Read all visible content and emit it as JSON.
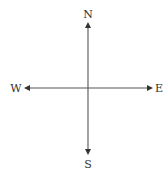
{
  "diagram": {
    "type": "compass-rose",
    "labels": {
      "north": "N",
      "south": "S",
      "east": "E",
      "west": "W"
    },
    "colors": {
      "line": "#555555",
      "text": "#333333",
      "background": "#ffffff"
    }
  }
}
